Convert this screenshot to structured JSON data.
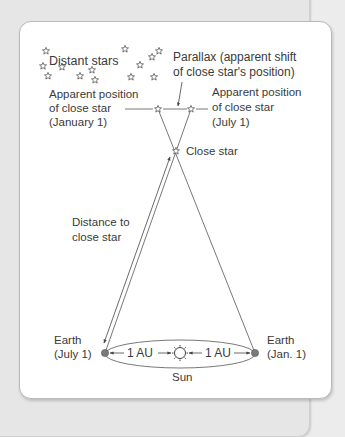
{
  "diagram": {
    "labels": {
      "distant_stars": "Distant stars",
      "parallax_line1": "Parallax (apparent shift",
      "parallax_line2": "of close star's position)",
      "apparent_left_line1": "Apparent position",
      "apparent_left_line2": "of close star",
      "apparent_left_line3": "(January 1)",
      "apparent_right_line1": "Apparent position",
      "apparent_right_line2": "of close star",
      "apparent_right_line3": "(July 1)",
      "close_star": "Close star",
      "distance_line1": "Distance to",
      "distance_line2": "close star",
      "earth_left_line1": "Earth",
      "earth_left_line2": "(July 1)",
      "earth_right_line1": "Earth",
      "earth_right_line2": "(Jan. 1)",
      "au_left": "1 AU",
      "au_right": "1 AU",
      "sun": "Sun"
    },
    "colors": {
      "line": "#555555",
      "text": "#3a3a3a",
      "earth": "#7a7a7a"
    }
  }
}
